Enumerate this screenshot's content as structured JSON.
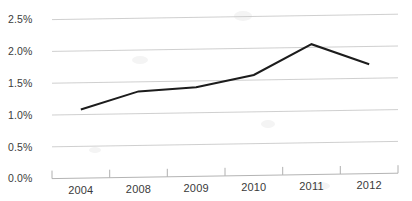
{
  "chart_data": {
    "type": "line",
    "title": "",
    "subtitle": "",
    "xlabel": "",
    "ylabel": "",
    "categories": [
      "2004",
      "2008",
      "2009",
      "2010",
      "2011",
      "2012"
    ],
    "values": [
      1.08,
      1.35,
      1.4,
      1.58,
      2.05,
      1.72
    ],
    "series": [
      {
        "name": "",
        "values": [
          1.08,
          1.35,
          1.4,
          1.58,
          2.05,
          1.72
        ]
      }
    ],
    "ylim": [
      0.0,
      2.5
    ],
    "ytick_values": [
      0.0,
      0.5,
      1.0,
      1.5,
      2.0,
      2.5
    ],
    "ytick_labels": [
      "0.0%",
      "0.5%",
      "1.0%",
      "1.5%",
      "2.0%",
      "2.5%"
    ],
    "xtick_labels": [
      "2004",
      "2008",
      "2009",
      "2010",
      "2011",
      "2012"
    ],
    "grid": true,
    "legend": false,
    "legend_position": "none",
    "annotations": [],
    "line_color": "#1c1c1c",
    "gridline_color": "#c9c9c9",
    "background_color": "#ffffff"
  },
  "axes": {
    "y_labels": {
      "t25": "2.5%",
      "t20": "2.0%",
      "t15": "1.5%",
      "t10": "1.0%",
      "t05": "0.5%",
      "t00": "0.0%"
    },
    "x_labels": {
      "c0": "2004",
      "c1": "2008",
      "c2": "2009",
      "c3": "2010",
      "c4": "2011",
      "c5": "2012"
    }
  }
}
